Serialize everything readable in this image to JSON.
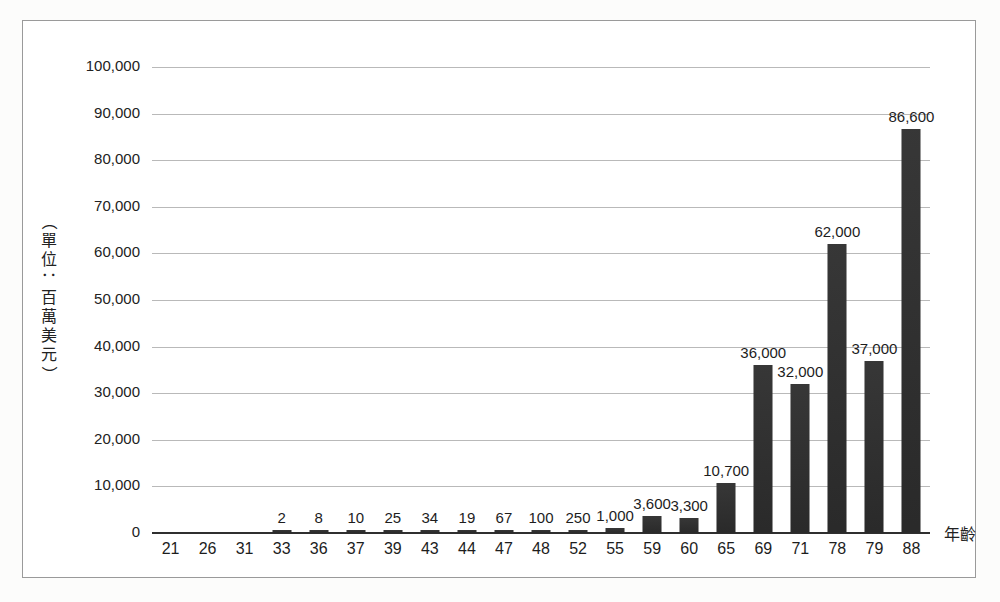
{
  "chart_data": {
    "type": "bar",
    "title": "",
    "xlabel": "年齡",
    "ylabel": "（單位：百萬美元）",
    "ylim": [
      0,
      100000
    ],
    "ytick_step": 10000,
    "ytick_labels": [
      "0",
      "10,000",
      "20,000",
      "30,000",
      "40,000",
      "50,000",
      "60,000",
      "70,000",
      "80,000",
      "90,000",
      "100,000"
    ],
    "ytick_values": [
      0,
      10000,
      20000,
      30000,
      40000,
      50000,
      60000,
      70000,
      80000,
      90000,
      100000
    ],
    "grid": true,
    "legend": "none",
    "bar_color": "#2c2c2c",
    "categories": [
      "21",
      "26",
      "31",
      "33",
      "36",
      "37",
      "39",
      "43",
      "44",
      "47",
      "48",
      "52",
      "55",
      "59",
      "60",
      "65",
      "69",
      "71",
      "78",
      "79",
      "88"
    ],
    "values": [
      0,
      0,
      0,
      2,
      8,
      10,
      25,
      34,
      19,
      67,
      100,
      250,
      1000,
      3600,
      3300,
      10700,
      36000,
      32000,
      62000,
      37000,
      86600
    ],
    "value_labels": [
      "",
      "",
      "",
      "2",
      "8",
      "10",
      "25",
      "34",
      "19",
      "67",
      "100",
      "250",
      "1,000",
      "3,600",
      "3,300",
      "10,700",
      "36,000",
      "32,000",
      "62,000",
      "37,000",
      "86,600"
    ]
  },
  "figure": {
    "border_color": "#9a9a9a",
    "background": "#ffffff"
  }
}
